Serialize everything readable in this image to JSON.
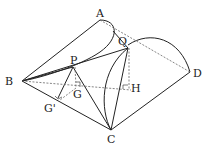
{
  "diagram": {
    "type": "3D geometry figure",
    "labels": {
      "A": "A",
      "Q": "Q",
      "P": "P",
      "B": "B",
      "D": "D",
      "G": "G",
      "H": "H",
      "G_prime": "G'",
      "C": "C"
    },
    "colors": {
      "line": "#222222",
      "dashed": "#555555",
      "background": "#ffffff"
    }
  }
}
